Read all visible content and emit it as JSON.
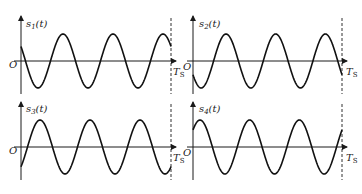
{
  "figure": {
    "panels": [
      {
        "id": "s1",
        "signal_label": "s",
        "signal_sub": "1",
        "signal_arg": "(t)",
        "origin_label": "O",
        "axis_end_label": "T",
        "axis_end_sub": "S",
        "description": "cosine-like, starts positive decreasing, 3 cycles over Ts",
        "phase_deg": 60
      },
      {
        "id": "s2",
        "signal_label": "s",
        "signal_sub": "2",
        "signal_arg": "(t)",
        "origin_label": "O",
        "axis_end_label": "T",
        "axis_end_sub": "S",
        "description": "starts negative decreasing, 3 cycles over Ts",
        "phase_deg": 150
      },
      {
        "id": "s3",
        "signal_label": "s",
        "signal_sub": "3",
        "signal_arg": "(t)",
        "origin_label": "O",
        "axis_end_label": "T",
        "axis_end_sub": "S",
        "description": "starts negative increasing, 3 cycles over Ts",
        "phase_deg": 240
      },
      {
        "id": "s4",
        "signal_label": "s",
        "signal_sub": "4",
        "signal_arg": "(t)",
        "origin_label": "O",
        "axis_end_label": "T",
        "axis_end_sub": "S",
        "description": "starts positive increasing, 3 cycles over Ts",
        "phase_deg": 330
      }
    ]
  }
}
